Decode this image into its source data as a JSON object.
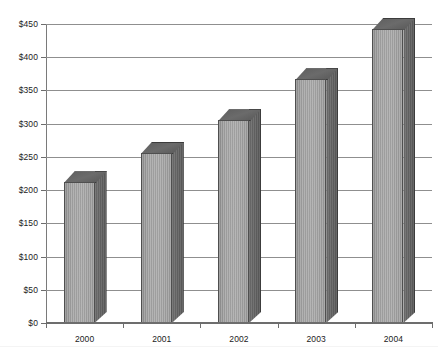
{
  "chart_data": {
    "type": "bar",
    "title": "",
    "subtitle": "",
    "xlabel": "",
    "ylabel": "",
    "categories": [
      "2000",
      "2001",
      "2002",
      "2003",
      "2004"
    ],
    "values": [
      212,
      256,
      305,
      367,
      443
    ],
    "value_labels": [
      "",
      "",
      "",
      "",
      ""
    ],
    "ylim": [
      0,
      450
    ],
    "ytick_values": [
      0,
      50,
      100,
      150,
      200,
      250,
      300,
      350,
      400,
      450
    ],
    "ytick_labels": [
      "$0",
      "$50",
      "$100",
      "$150",
      "$200",
      "$250",
      "$300",
      "$350",
      "$400",
      "$450"
    ],
    "xtick_labels": [
      "2000",
      "2001",
      "2002",
      "2003",
      "2004"
    ],
    "grid": true,
    "grid_axis": "y",
    "legend": false,
    "legend_position": "none",
    "style": "3d-bar",
    "series": [
      {
        "name": "",
        "values": [
          212,
          256,
          305,
          367,
          443
        ]
      }
    ],
    "colors": {
      "bar_front": "#a3a3a3",
      "bar_side": "#636363",
      "bar_top": "#5e5e5e",
      "bar_outline": "#4f4f4f",
      "gridline": "#8f8f8f",
      "axis": "#6d6d6d",
      "text": "#1b1b1b",
      "background": "#ffffff"
    }
  }
}
